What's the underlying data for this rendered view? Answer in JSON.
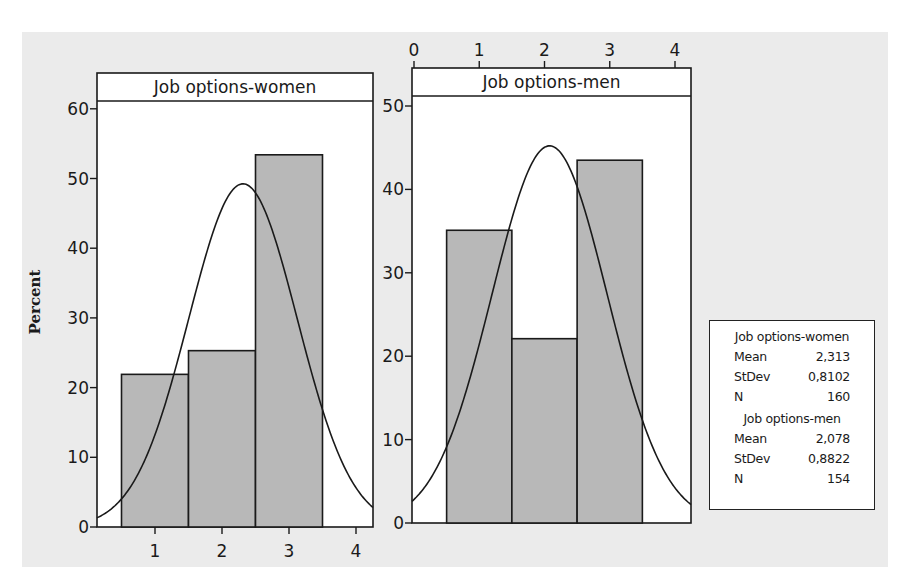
{
  "chart_data": {
    "type": "bar",
    "subtype": "histogram-with-normal-fit",
    "ylabel": "Percent",
    "panels": [
      {
        "title": "Job options-women",
        "x_axis_position": "bottom",
        "x_ticks": [
          1,
          2,
          3,
          4
        ],
        "y_ticks": [
          0,
          10,
          20,
          30,
          40,
          50,
          60
        ],
        "ylim": [
          0,
          60
        ],
        "categories": [
          1,
          2,
          3
        ],
        "bin_edges": [
          0.5,
          1.5,
          2.5,
          3.5
        ],
        "values": [
          21.9,
          25.3,
          53.4
        ],
        "fit": {
          "type": "normal",
          "mean": 2.313,
          "stdev": 0.8102,
          "n": 160
        }
      },
      {
        "title": "Job options-men",
        "x_axis_position": "top",
        "x_ticks": [
          0,
          1,
          2,
          3,
          4
        ],
        "y_ticks": [
          0,
          10,
          20,
          30,
          40,
          50
        ],
        "ylim": [
          0,
          50
        ],
        "categories": [
          1,
          2,
          3
        ],
        "bin_edges": [
          0.5,
          1.5,
          2.5,
          3.5
        ],
        "values": [
          35.1,
          22.1,
          43.5
        ],
        "fit": {
          "type": "normal",
          "mean": 2.078,
          "stdev": 0.8822,
          "n": 154
        }
      }
    ],
    "legend": {
      "position": "right",
      "entries": [
        {
          "title": "Job options-women",
          "rows": [
            [
              "Mean",
              "2,313"
            ],
            [
              "StDev",
              "0,8102"
            ],
            [
              "N",
              "160"
            ]
          ]
        },
        {
          "title": "Job options-men",
          "rows": [
            [
              "Mean",
              "2,078"
            ],
            [
              "StDev",
              "0,8822"
            ],
            [
              "N",
              "154"
            ]
          ]
        }
      ]
    }
  },
  "colors": {
    "background": "#ebebeb",
    "plot_area": "#ffffff",
    "bar_fill": "#b8b8b8",
    "line": "#1a1a1a"
  }
}
